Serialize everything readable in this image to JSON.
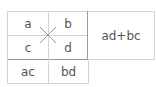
{
  "diagram": {
    "cells": {
      "top_left": "a",
      "top_right": "b",
      "bottom_left": "c",
      "bottom_right": "d",
      "product_left": "ac",
      "product_right": "bd",
      "result": "ad+bc"
    },
    "cross_icon": "x-cross-icon",
    "colors": {
      "line": "#d4d4d4",
      "line_dark": "#9a9a9a",
      "text": "#555555",
      "cross": "#999999"
    }
  }
}
